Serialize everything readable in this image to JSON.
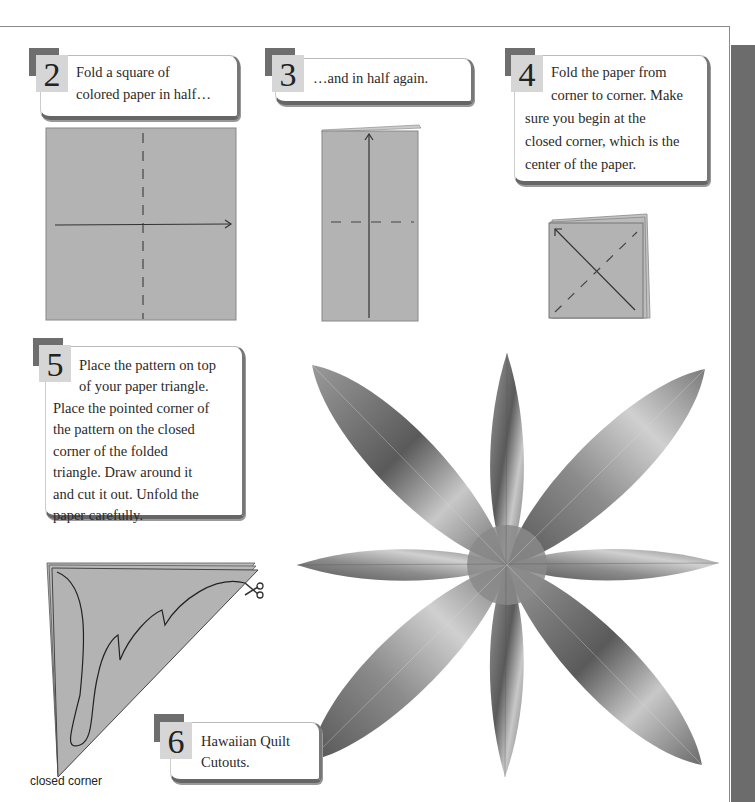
{
  "colors": {
    "paper": "#b3b3b3",
    "number_box": "#d6d6d6",
    "number_shadow": "#6e6e6e",
    "sidebar": "#6c6c6c"
  },
  "steps": [
    {
      "number": "2",
      "lines": [
        "Fold a square of",
        "colored paper in half…"
      ]
    },
    {
      "number": "3",
      "lines": [
        "…and in half again."
      ]
    },
    {
      "number": "4",
      "lines": [
        "Fold the paper from",
        "corner to corner. Make",
        "sure you begin at the",
        "closed corner, which is the",
        "center of the paper."
      ]
    },
    {
      "number": "5",
      "lines": [
        "Place the pattern on top",
        "of your paper triangle.",
        "Place the pointed corner of",
        "the pattern on the closed",
        "corner of the folded",
        "triangle. Draw around it",
        "and cut it out. Unfold the",
        "paper carefully."
      ]
    },
    {
      "number": "6",
      "lines": [
        "Hawaiian Quilt",
        "Cutouts."
      ]
    }
  ],
  "illustrations": {
    "step2": "square-paper-fold-diagram",
    "step3": "rectangle-fold-diagram",
    "step4": "square-diagonal-fold-diagram",
    "step5": "triangle-pattern-diagram",
    "step5_icon": "scissors-icon",
    "step6": "eight-petal-cutout-photo"
  },
  "labels": {
    "closed_corner": "closed corner"
  }
}
